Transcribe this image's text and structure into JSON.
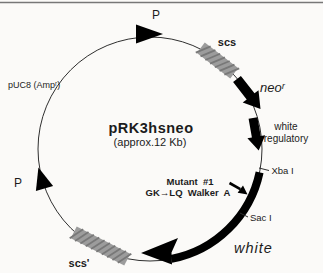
{
  "figure": {
    "type": "plasmid-map",
    "title": "pRK3hsneo",
    "subtitle": "(approx.12 Kb)",
    "plasmid": {
      "backbone_label": "pUC8 (Ampʳ)",
      "promoter_top_label": "P",
      "promoter_left_label": "P",
      "scs_label": "scs",
      "scs_prime_label": "scs'",
      "neo_gene_label": "neoʳ",
      "white_regulatory_label_line1": "white",
      "white_regulatory_label_line2": "regulatory",
      "white_gene_label": "white",
      "xba_site_label": "Xba I",
      "sac_site_label": "Sac I",
      "mutation_note_line1": "Mutant  #1",
      "mutation_note_line2": "GK→LQ  Walker  A"
    },
    "colors": {
      "feature_black": "#000000",
      "scs_box_gray": "#9c9c9c",
      "scs_hatch_gray": "#787878",
      "circle_outline": "#2f2f2f",
      "background": "#fbfaf8"
    }
  }
}
